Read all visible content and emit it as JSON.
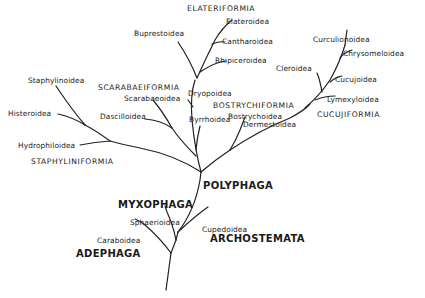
{
  "diagram": {
    "type": "phylogenetic-tree",
    "suborders": {
      "polyphaga": "POLYPHAGA",
      "myxophaga": "MYXOPHAGA",
      "archostemata": "ARCHOSTEMATA",
      "adephaga": "ADEPHAGA"
    },
    "infraorders": {
      "elateriformia": "ELATERIFORMIA",
      "scarabaeiformia": "SCARABAEIFORMIA",
      "bostrychiformia": "BOSTRYCHIFORMIA",
      "cucujiformia": "CUCUJIFORMIA",
      "staphyliniformia": "STAPHYLINIFORMIA"
    },
    "superfamilies": {
      "elateroidea": "Elateroidea",
      "buprestoidea": "Buprestoidea",
      "cantharoidea": "Cantharoidea",
      "rhipiceroidea": "Rhipiceroidea",
      "dryopoidea": "Dryopoidea",
      "scarabaeoidea": "Scarabaeoidea",
      "dascilloidea": "Dascilloidea",
      "byrrhoidea": "Byrrhoidea",
      "staphylinoidea": "Staphylinoidea",
      "histeroidea": "Histeroidea",
      "hydrophiloidea": "Hydrophiloidea",
      "curculionoidea": "Curculionoidea",
      "chrysomeloidea": "Chrysomeloidea",
      "cleroidea": "Cleroidea",
      "cucujoidea": "Cucujoidea",
      "lymexyloidea": "Lymexyloidea",
      "bostrychoidea": "Bostrychoidea",
      "dermestoidea": "Dermestoidea",
      "sphaerioidea": "Sphaerioidea",
      "cupedoidea": "Cupedoidea",
      "caraboidea": "Caraboidea"
    },
    "colors": {
      "line": "#222222",
      "text": "#1a1a1a",
      "background": "#ffffff"
    }
  }
}
